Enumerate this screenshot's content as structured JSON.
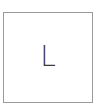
{
  "tile": {
    "letter": "L",
    "border_color": "#9a9a9a",
    "text_color": "#3a3a3a"
  }
}
